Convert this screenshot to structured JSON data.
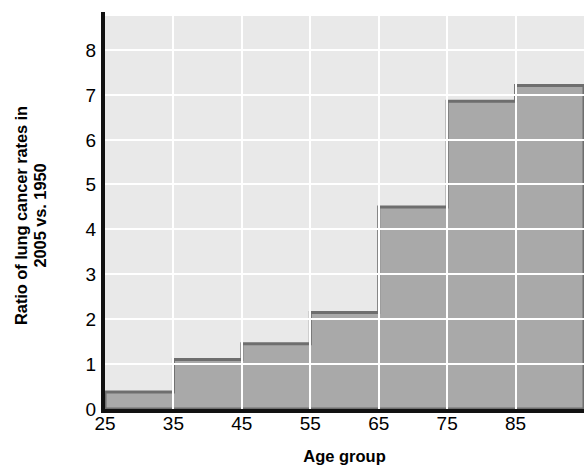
{
  "chart_data": {
    "type": "area",
    "title": "",
    "subtitle": "",
    "xlabel": "Age group",
    "ylabel_line1": "Ratio of lung cancer rates in",
    "ylabel_line2": "2005 vs. 1950",
    "ylabel_full": "Ratio of lung cancer rates in 2005 vs. 1950",
    "categories": [
      "25-35",
      "35-45",
      "45-55",
      "55-65",
      "65-75",
      "75-85",
      "85+"
    ],
    "x_bin_edges": [
      25,
      35,
      45,
      55,
      65,
      75,
      85,
      95
    ],
    "values": [
      0.38,
      1.1,
      1.45,
      2.15,
      4.5,
      6.85,
      7.2
    ],
    "x_ticks": [
      "25",
      "35",
      "45",
      "55",
      "65",
      "75",
      "85"
    ],
    "x_tick_values": [
      25,
      35,
      45,
      55,
      65,
      75,
      85
    ],
    "y_ticks": [
      "0",
      "1",
      "2",
      "3",
      "4",
      "5",
      "6",
      "7",
      "8"
    ],
    "y_tick_values": [
      0,
      1,
      2,
      3,
      4,
      5,
      6,
      7,
      8
    ],
    "xlim": [
      25,
      95
    ],
    "ylim": [
      0,
      8.75
    ],
    "grid": true,
    "legend": "none",
    "reference_line": {
      "value": 1,
      "style": "dashed",
      "label": ""
    },
    "colors": {
      "plot_background": "#e9e9e9",
      "gridline": "#ffffff",
      "area_fill": "#a9a9a9",
      "area_outline": "#6e6e6e",
      "axis": "#111111",
      "text": "#000000",
      "reference_line": "#1a1a1a"
    }
  }
}
